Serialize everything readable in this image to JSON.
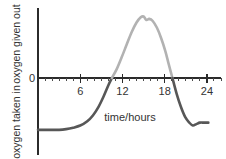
{
  "chart_data": {
    "type": "line",
    "title": "",
    "xlabel": "time/hours",
    "ylabel_positive": "oxygen given out",
    "ylabel_negative": "oxygen taken in",
    "zero_label": "0",
    "xlim": [
      0,
      26
    ],
    "ylim": [
      -1.0,
      2.6
    ],
    "grid": false,
    "legend": "none",
    "xticks_major": [
      6,
      12,
      18,
      24
    ],
    "xtick_labels": [
      "6",
      "12",
      "18",
      "24"
    ],
    "xtick_minor_interval": 1,
    "zero_crossings": [
      10.5,
      19.1
    ],
    "peak": {
      "x": 15.0,
      "y": 2.35
    },
    "baseline_left": -0.72,
    "baseline_right": -0.62,
    "series": [
      {
        "name": "oxygen taken in (net uptake, negative)",
        "color": "#575757",
        "x": [
          0.0,
          1.0,
          2.0,
          3.0,
          4.0,
          5.0,
          6.0,
          7.0,
          7.8,
          8.6,
          9.3,
          10.0,
          10.5
        ],
        "y": [
          -0.72,
          -0.72,
          -0.72,
          -0.72,
          -0.71,
          -0.69,
          -0.66,
          -0.6,
          -0.52,
          -0.4,
          -0.26,
          -0.1,
          0.0
        ]
      },
      {
        "name": "oxygen given out (net release, positive)",
        "color": "#b2b2b2",
        "x": [
          10.5,
          11.2,
          11.9,
          12.6,
          13.3,
          14.0,
          14.6,
          15.0,
          15.4,
          15.8,
          16.3,
          16.9,
          17.5,
          18.1,
          18.6,
          19.1
        ],
        "y": [
          0.0,
          0.35,
          0.8,
          1.28,
          1.75,
          2.12,
          2.32,
          2.35,
          2.22,
          2.26,
          2.18,
          1.92,
          1.52,
          1.02,
          0.5,
          0.0
        ]
      },
      {
        "name": "oxygen taken in (evening fall, negative)",
        "color": "#575757",
        "x": [
          19.1,
          19.7,
          20.3,
          20.9,
          21.5,
          22.0,
          22.5,
          23.0,
          23.6,
          24.2
        ],
        "y": [
          0.0,
          -0.22,
          -0.4,
          -0.54,
          -0.62,
          -0.66,
          -0.64,
          -0.62,
          -0.62,
          -0.62
        ]
      }
    ]
  },
  "colors": {
    "axis": "#2b2b2b",
    "curve_negative": "#575757",
    "curve_positive": "#b2b2b2",
    "text": "#333333",
    "background": "#ffffff"
  }
}
